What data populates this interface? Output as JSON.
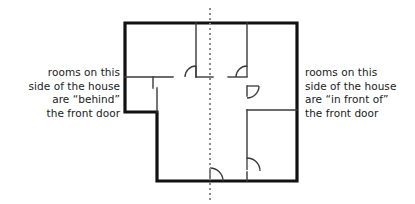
{
  "figure": {
    "type": "floor-plan-diagram",
    "title": "",
    "background_color": "#ffffff"
  },
  "captions": {
    "left": {
      "text": "rooms on this\nside of the house\nare “behind”\nthe front door",
      "align": "right",
      "color": "#1a1a1a"
    },
    "right": {
      "text": "rooms on this\nside of the house\nare “in front of”\nthe front door",
      "align": "left",
      "color": "#1a1a1a"
    }
  },
  "divider": {
    "name": "vertical-dashed-divider-line",
    "orientation": "vertical",
    "x": 210,
    "y_start": 8,
    "y_end": 200,
    "color": "#8c8c8c",
    "dash": "2 3",
    "width": 2
  },
  "plan": {
    "exterior_wall_color": "#111111",
    "exterior_wall_width": 3.2,
    "interior_wall_color": "#3a3a3a",
    "interior_wall_width": 1.4,
    "door_arc_color": "#3a3a3a",
    "door_arc_width": 1.2,
    "outline_points": "125,23 297,23 297,181 157,181 157,112 125,112 125,23",
    "interior_walls": [
      {
        "name": "top-left-vertical-wall",
        "x1": 196,
        "y1": 23,
        "x2": 196,
        "y2": 77
      },
      {
        "name": "upper-horizontal-wall-left",
        "x1": 125,
        "y1": 77,
        "x2": 173,
        "y2": 77
      },
      {
        "name": "upper-horizontal-wall-right",
        "x1": 196,
        "y1": 77,
        "x2": 213,
        "y2": 77
      },
      {
        "name": "upper-horizontal-wall-far-right",
        "x1": 228,
        "y1": 77,
        "x2": 247,
        "y2": 77
      },
      {
        "name": "left-room-divider-stub",
        "x1": 153,
        "y1": 77,
        "x2": 153,
        "y2": 88
      },
      {
        "name": "right-vertical-wall-upper",
        "x1": 247,
        "y1": 23,
        "x2": 247,
        "y2": 66
      },
      {
        "name": "right-vertical-wall-mid",
        "x1": 247,
        "y1": 86,
        "x2": 247,
        "y2": 96
      },
      {
        "name": "right-vertical-wall-lower",
        "x1": 247,
        "y1": 110,
        "x2": 247,
        "y2": 158
      },
      {
        "name": "right-vertical-wall-bottom",
        "x1": 247,
        "y1": 172,
        "x2": 247,
        "y2": 181
      },
      {
        "name": "right-room-horizontal-divider",
        "x1": 247,
        "y1": 110,
        "x2": 297,
        "y2": 110
      },
      {
        "name": "left-notch-stub",
        "x1": 157,
        "y1": 88,
        "x2": 157,
        "y2": 112
      }
    ],
    "doors": [
      {
        "name": "door-upper-left",
        "hinge_x": 196,
        "hinge_y": 77,
        "radius": 11,
        "sweep": "left-up",
        "jamb": {
          "x1": 196,
          "y1": 66,
          "x2": 196,
          "y2": 77
        }
      },
      {
        "name": "door-upper-right",
        "hinge_x": 247,
        "hinge_y": 77,
        "radius": 11,
        "sweep": "left-up",
        "jamb": {
          "x1": 247,
          "y1": 66,
          "x2": 247,
          "y2": 77
        }
      },
      {
        "name": "door-right-middle",
        "hinge_x": 247,
        "hinge_y": 86,
        "radius": 12,
        "sweep": "right-down",
        "jamb": {
          "x1": 247,
          "y1": 86,
          "x2": 259,
          "y2": 86
        }
      },
      {
        "name": "door-right-lower",
        "hinge_x": 247,
        "hinge_y": 158,
        "radius": 13,
        "sweep": "right-up",
        "jamb": {
          "x1": 247,
          "y1": 170,
          "x2": 247,
          "y2": 158
        }
      },
      {
        "name": "front-door",
        "hinge_x": 210,
        "hinge_y": 181,
        "radius": 13,
        "sweep": "right-up",
        "jamb": {
          "x1": 210,
          "y1": 181,
          "x2": 210,
          "y2": 168
        }
      }
    ]
  }
}
